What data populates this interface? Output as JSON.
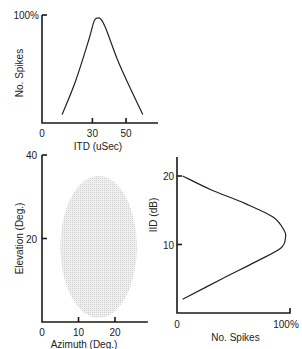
{
  "chart_data": [
    {
      "type": "line",
      "panel": "top",
      "xlabel": "ITD (uSec)",
      "ylabel": "No. Spikes",
      "xticks": [
        0,
        30,
        50
      ],
      "ytick_labels": [
        "100%"
      ],
      "xlim": [
        0,
        70
      ],
      "ylim": [
        0,
        100
      ],
      "x": [
        12,
        20,
        28,
        31,
        33,
        35,
        38,
        45,
        52,
        60
      ],
      "y": [
        8,
        40,
        80,
        97,
        100,
        99,
        90,
        60,
        35,
        8
      ]
    },
    {
      "type": "scatter",
      "panel": "bottom-left",
      "description": "shaded elliptical receptive field",
      "xlabel": "Azimuth (Deg.)",
      "ylabel": "Elevation (Deg.)",
      "xticks": [
        0,
        10,
        20
      ],
      "yticks": [
        20,
        40
      ],
      "xlim": [
        0,
        29
      ],
      "ylim": [
        0,
        40
      ],
      "ellipse": {
        "center_azimuth": 15.5,
        "center_elevation": 18,
        "azimuth_halfwidth": 10.5,
        "elevation_halfheight": 17
      },
      "fill_color": "#e6e6e6"
    },
    {
      "type": "line",
      "panel": "bottom-right",
      "xlabel": "No. Spikes",
      "ylabel": "IID (dB)",
      "xtick_labels": [
        "0",
        "100%"
      ],
      "yticks": [
        10,
        20
      ],
      "xlim": [
        0,
        100
      ],
      "ylim": [
        0,
        23
      ],
      "x": [
        5,
        30,
        60,
        85,
        95,
        96,
        92,
        70,
        40,
        5
      ],
      "y": [
        20,
        18,
        16,
        14,
        12,
        11,
        9.5,
        7.5,
        5,
        2
      ]
    }
  ]
}
